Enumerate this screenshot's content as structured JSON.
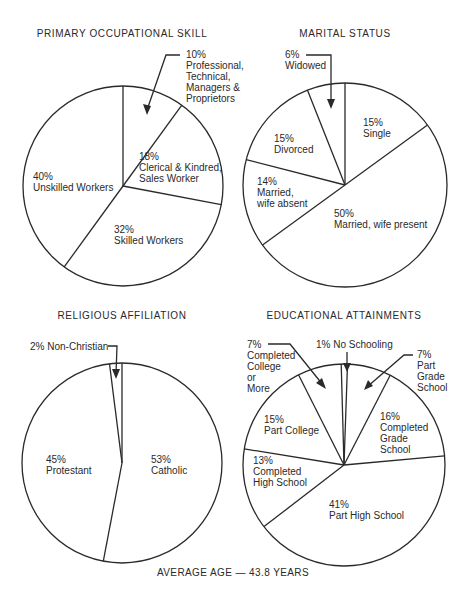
{
  "chart_data": [
    {
      "type": "pie",
      "id": "occupational",
      "title": "PRIMARY OCCUPATIONAL SKILL",
      "center": [
        123,
        186
      ],
      "radius": 100,
      "start_angle_deg": 0,
      "slices": [
        {
          "label": "Professional, Technical, Managers & Proprietors",
          "value": 10
        },
        {
          "label": "Clerical & Kindred, Sales Worker",
          "value": 18
        },
        {
          "label": "Skilled Workers",
          "value": 32
        },
        {
          "label": "Unskilled Workers",
          "value": 40
        }
      ]
    },
    {
      "type": "pie",
      "id": "marital",
      "title": "MARITAL STATUS",
      "center": [
        345,
        185
      ],
      "radius": 102,
      "start_angle_deg": 0,
      "slices": [
        {
          "label": "Single",
          "value": 15
        },
        {
          "label": "Married, wife present",
          "value": 50
        },
        {
          "label": "Married, wife absent",
          "value": 14
        },
        {
          "label": "Divorced",
          "value": 15
        },
        {
          "label": "Widowed",
          "value": 6
        }
      ]
    },
    {
      "type": "pie",
      "id": "religious",
      "title": "RELIGIOUS AFFILIATION",
      "center": [
        122,
        463
      ],
      "radius": 100,
      "start_angle_deg": 0,
      "slices": [
        {
          "label": "Catholic",
          "value": 53
        },
        {
          "label": "Protestant",
          "value": 45
        },
        {
          "label": "Non-Christian",
          "value": 2
        }
      ]
    },
    {
      "type": "pie",
      "id": "educational",
      "title": "EDUCATIONAL ATTAINMENTS",
      "center": [
        344,
        465
      ],
      "radius": 101,
      "start_angle_deg": 2,
      "slices": [
        {
          "label": "Part Grade School",
          "value": 7
        },
        {
          "label": "Completed Grade School",
          "value": 16
        },
        {
          "label": "Part High School",
          "value": 41
        },
        {
          "label": "Completed High School",
          "value": 13
        },
        {
          "label": "Part College",
          "value": 15
        },
        {
          "label": "Completed College or More",
          "value": 7
        },
        {
          "label": "No Schooling",
          "value": 1
        }
      ]
    }
  ],
  "titles": {
    "occupational": "PRIMARY OCCUPATIONAL SKILL",
    "marital": "MARITAL STATUS",
    "religious": "RELIGIOUS AFFILIATION",
    "educational": "EDUCATIONAL ATTAINMENTS"
  },
  "labels": {
    "occ_professional": "10%\nProfessional,\nTechnical,\nManagers &\nProprietors",
    "occ_clerical": "18%\nClerical & Kindred,\nSales Worker",
    "occ_skilled": "32%\nSkilled Workers",
    "occ_unskilled": "40%\nUnskilled Workers",
    "mar_widowed": "6%\nWidowed",
    "mar_single": "15%\nSingle",
    "mar_divorced": "15%\nDivorced",
    "mar_absent": "14%\nMarried,\nwife absent",
    "mar_present": "50%\nMarried, wife present",
    "rel_nonchristian": "2% Non-Christian",
    "rel_protestant": "45%\nProtestant",
    "rel_catholic": "53%\nCatholic",
    "edu_college_complete": "7%\nCompleted\nCollege\nor\nMore",
    "edu_no_schooling": "1% No Schooling",
    "edu_part_grade": "7%\nPart\nGrade\nSchool",
    "edu_part_college": "15%\nPart College",
    "edu_completed_grade": "16%\nCompleted\nGrade\nSchool",
    "edu_completed_high": "13%\nCompleted\nHigh School",
    "edu_part_high": "41%\nPart High School"
  },
  "footer": "AVERAGE AGE — 43.8 YEARS",
  "colors": {
    "ink": "#2a2a2a",
    "background": "#ffffff"
  }
}
